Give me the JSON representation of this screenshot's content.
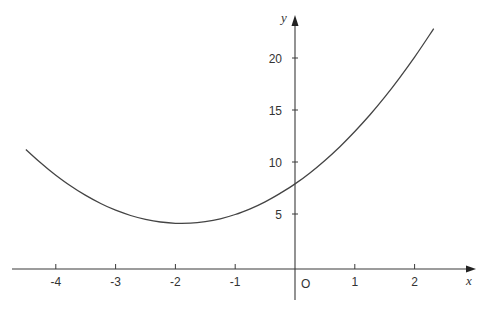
{
  "chart_data": {
    "type": "line",
    "title": "",
    "xlabel": "x",
    "ylabel": "y",
    "origin_label": "O",
    "xlim": [
      -4.7,
      3.0
    ],
    "ylim": [
      -3.3,
      24
    ],
    "x_ticks": [
      -4,
      -3,
      -2,
      -1,
      1,
      2
    ],
    "x_tick_labels": [
      "-4",
      "-3",
      "-2",
      "-1",
      "1",
      "2"
    ],
    "y_ticks": [
      5,
      10,
      15,
      20
    ],
    "y_tick_labels": [
      "5",
      "10",
      "15",
      "20"
    ],
    "grid": false,
    "legend": "none",
    "series": [
      {
        "name": "curve",
        "description": "Parabola with minimum near (-1.9, 4.1), y-intercept near 8",
        "x": [
          -4.5,
          -4.25,
          -4.0,
          -3.75,
          -3.5,
          -3.25,
          -3.0,
          -2.75,
          -2.5,
          -2.25,
          -2.0,
          -1.75,
          -1.5,
          -1.25,
          -1.0,
          -0.75,
          -0.5,
          -0.25,
          0.0,
          0.25,
          0.5,
          0.75,
          1.0,
          1.25,
          1.5,
          1.75,
          2.0,
          2.25,
          2.32
        ],
        "y": [
          11.2,
          9.9,
          8.73,
          7.69,
          6.79,
          6.01,
          5.37,
          4.86,
          4.48,
          4.23,
          4.11,
          4.12,
          4.27,
          4.54,
          4.95,
          5.5,
          6.17,
          6.98,
          7.89,
          8.95,
          10.15,
          11.47,
          12.93,
          14.52,
          16.24,
          18.1,
          20.09,
          22.21,
          22.82
        ]
      }
    ]
  }
}
